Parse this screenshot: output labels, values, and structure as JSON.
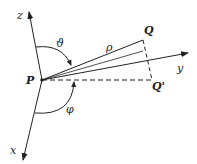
{
  "diagram": {
    "labels": {
      "z_axis": "z",
      "y_axis": "y",
      "x_axis": "x",
      "origin": "P",
      "point": "Q",
      "projection": "Q'",
      "radius": "ρ",
      "polar_angle": "ϑ",
      "azimuth_angle": "φ"
    },
    "colors": {
      "stroke": "#222222",
      "background": "#ffffff"
    }
  }
}
